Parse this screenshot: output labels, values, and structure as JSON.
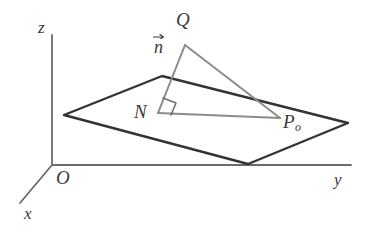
{
  "figure": {
    "kind": "3d-geometry-diagram",
    "width": 374,
    "height": 237,
    "background_color": "#ffffff"
  },
  "colors": {
    "axis": "#6b6b6b",
    "plane_edge": "#333333",
    "construction_line": "#8a8a8a",
    "label_text": "#3a3a3a",
    "right_angle": "#6e6e6e"
  },
  "axes": {
    "z": {
      "label": "z",
      "label_x": 38,
      "label_y": 19,
      "from": [
        52,
        165
      ],
      "to": [
        52,
        35
      ]
    },
    "y": {
      "label": "y",
      "label_x": 334,
      "label_y": 171,
      "from": [
        52,
        165
      ],
      "to": [
        351,
        165
      ]
    },
    "x": {
      "label": "x",
      "label_x": 24,
      "label_y": 205,
      "from": [
        52,
        165
      ],
      "to": [
        20,
        203
      ]
    },
    "origin": {
      "label": "O",
      "label_x": 56,
      "label_y": 168
    }
  },
  "plane": {
    "name": "plane-parallelogram",
    "vertices": [
      [
        64,
        115
      ],
      [
        162,
        76
      ],
      [
        348,
        123
      ],
      [
        248,
        164
      ]
    ]
  },
  "points": {
    "Q": {
      "label": "Q",
      "x": 185,
      "y": 45,
      "label_x": 176,
      "label_y": 10
    },
    "N": {
      "label": "N",
      "x": 158,
      "y": 113,
      "label_x": 134,
      "label_y": 102
    },
    "P0": {
      "label": "P",
      "subscript": "o",
      "x": 280,
      "y": 118,
      "label_x": 283,
      "label_y": 112
    }
  },
  "vectors": {
    "n": {
      "label": "n",
      "has_arrow_accent": true,
      "label_x": 154,
      "label_y": 38
    }
  },
  "segments": [
    {
      "name": "segment-N-Q-normal",
      "from": [
        158,
        113
      ],
      "to": [
        185,
        45
      ]
    },
    {
      "name": "segment-Q-P0",
      "from": [
        185,
        45
      ],
      "to": [
        280,
        118
      ]
    },
    {
      "name": "segment-N-P0",
      "from": [
        158,
        113
      ],
      "to": [
        280,
        118
      ]
    }
  ],
  "right_angle_marker": {
    "name": "right-angle-at-N",
    "points": [
      [
        163,
        98
      ],
      [
        176,
        103
      ],
      [
        171,
        115
      ]
    ]
  }
}
